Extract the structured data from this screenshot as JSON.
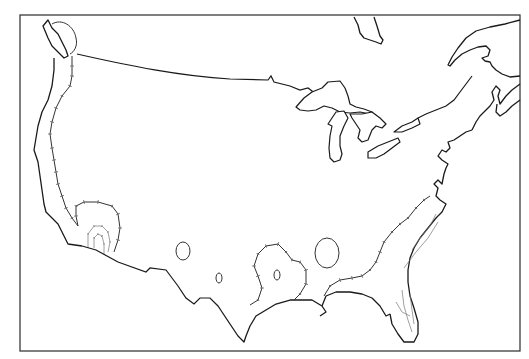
{
  "map": {
    "title": "",
    "type": "line-map",
    "region": "Contiguous United States",
    "style": "black-and-white outline with hachured isoline contours",
    "colors": {
      "background": "#ffffff",
      "lines": "#1a1a1a",
      "contours": "#333333",
      "inner_contours": "#777777"
    },
    "frame": {
      "x": 20,
      "y": 15,
      "width": 500,
      "height": 336
    },
    "features": [
      {
        "id": "coastline-pacific",
        "kind": "coastline"
      },
      {
        "id": "coastline-gulf",
        "kind": "coastline"
      },
      {
        "id": "coastline-atlantic",
        "kind": "coastline"
      },
      {
        "id": "canada-border",
        "kind": "border"
      },
      {
        "id": "mexico-border",
        "kind": "border"
      },
      {
        "id": "great-lakes",
        "kind": "water",
        "names_visible": false
      },
      {
        "id": "hudson-bay-tip",
        "kind": "water"
      },
      {
        "id": "gulf-of-st-lawrence",
        "kind": "water"
      },
      {
        "id": "contour-pacific-coast",
        "kind": "isoline"
      },
      {
        "id": "contour-southwest-nested",
        "kind": "isoline",
        "rings": 3
      },
      {
        "id": "contour-oval-west-texas",
        "kind": "isoline"
      },
      {
        "id": "contour-small-oval-texas",
        "kind": "isoline"
      },
      {
        "id": "contour-lobe-east-texas",
        "kind": "isoline"
      },
      {
        "id": "contour-oval-louisiana",
        "kind": "isoline"
      },
      {
        "id": "contour-gulf-atlantic-coast",
        "kind": "isoline"
      },
      {
        "id": "contour-florida-inner",
        "kind": "isoline"
      },
      {
        "id": "contour-puget-sound",
        "kind": "isoline"
      }
    ],
    "labels": []
  }
}
